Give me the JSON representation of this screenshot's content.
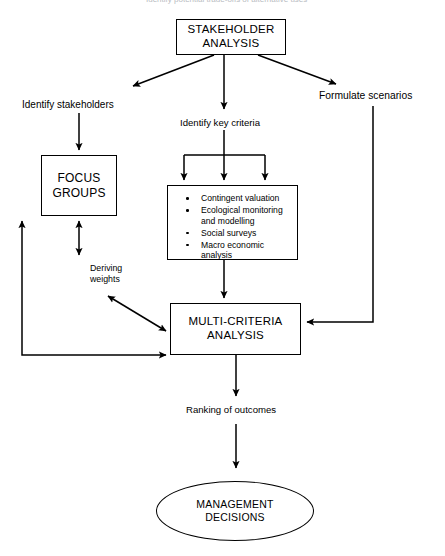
{
  "page": {
    "header_partial_text": "Identify potential trade-offs of alternative uses"
  },
  "nodes": {
    "stakeholder_analysis": {
      "line1": "STAKEHOLDER",
      "line2": "ANALYSIS"
    },
    "focus_groups": {
      "line1": "FOCUS",
      "line2": "GROUPS"
    },
    "multi_criteria_analysis": {
      "line1": "MULTI-CRITERIA",
      "line2": "ANALYSIS"
    },
    "management_decisions": {
      "line1": "MANAGEMENT",
      "line2": "DECISIONS"
    },
    "criteria_box": {
      "items": [
        {
          "line1": "Contingent valuation",
          "line2": ""
        },
        {
          "line1": "Ecological monitoring",
          "line2": "and modelling"
        },
        {
          "line1": "Social surveys",
          "line2": ""
        },
        {
          "line1": "Macro economic",
          "line2": "analysis"
        }
      ]
    }
  },
  "labels": {
    "identify_stakeholders": "Identify stakeholders",
    "identify_key_criteria": "Identify key criteria",
    "formulate_scenarios": "Formulate scenarios",
    "deriving_weights_line1": "Deriving",
    "deriving_weights_line2": "weights",
    "ranking_of_outcomes": "Ranking of outcomes"
  },
  "colors": {
    "stroke": "#000000",
    "background": "#ffffff",
    "header_faint": "#b9bcc2"
  }
}
